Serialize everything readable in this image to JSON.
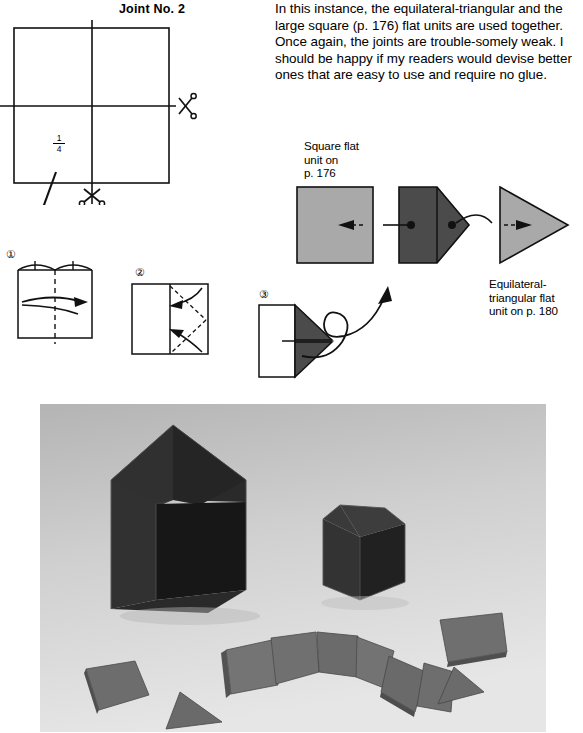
{
  "page": {
    "title": "Joint No. 2",
    "body_paragraph": "In this instance, the equilateral-triangular and the large square (p. 176) flat units are used together. Once again, the joints are trouble-somely weak. I should be happy if my readers would devise better ones that are easy to use and require no glue."
  },
  "construction": {
    "fraction_numerator": "1",
    "fraction_denominator": "4",
    "cut_icon_right": "scissors-icon",
    "cut_icon_bottom": "scissors-icon"
  },
  "steps": [
    {
      "number": "①",
      "name": "fold-in-half-step"
    },
    {
      "number": "②",
      "name": "fold-corners-step"
    },
    {
      "number": "③",
      "name": "finished-unit-step"
    }
  ],
  "assembly": {
    "square_unit_label": "Square flat\nunit on\np. 176",
    "square_unit_label_lines": [
      "Square flat",
      "unit on",
      "p. 176"
    ],
    "triangular_unit_label_lines": [
      "Equilateral-",
      "triangular flat",
      "unit on p. 180"
    ]
  },
  "colors": {
    "light_gray_unit": "#a9a9a9",
    "dark_gray_unit": "#4b4b4b",
    "ink": "#111111",
    "photo_background": "#c9c9c9",
    "photo_model_dark": "#2e2e2e",
    "photo_unit_gray": "#6f6f6f"
  },
  "photo": {
    "name": "finished-models-photograph",
    "subjects": [
      "pentagonal prism model",
      "cube model",
      "scattered square flat units",
      "triangular flat unit"
    ]
  }
}
